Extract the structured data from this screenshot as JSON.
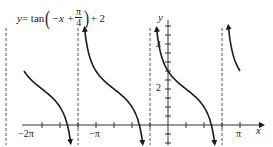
{
  "chart_data": {
    "type": "line",
    "title_parts": {
      "lhs": "y",
      "eq": " = tan",
      "inner_a": "−x +",
      "frac_num": "π",
      "frac_den": "4",
      "tail": "+ 2"
    },
    "function": "tan(-x + pi/4) + 2",
    "xlabel": "x",
    "ylabel": "y",
    "x_tick_labels": [
      "−2π",
      "−π",
      "π"
    ],
    "y_tick_labels": [
      "2",
      "4"
    ],
    "xlim": [
      "−2π",
      "π"
    ],
    "ylim": [
      -1,
      5.5
    ],
    "x_tick_spacing": "π/4",
    "y_tick_spacing": 0.5,
    "vertical_asymptotes": [
      "−9π/4",
      "−5π/4",
      "−π/4",
      "3π/4"
    ],
    "asymptote_style": "dashed",
    "grid": false,
    "legend": null,
    "branches": [
      {
        "x_from": "−2π",
        "x_to": "−5π/4",
        "start_y": 3,
        "end": "arrow down"
      },
      {
        "x_from": "−5π/4",
        "x_to": "−π/4",
        "start": "arrow up",
        "end": "arrow down"
      },
      {
        "x_from": "−π/4",
        "x_to": "3π/4",
        "start": "arrow up",
        "end": "arrow down",
        "y_intercept": 3
      },
      {
        "x_from": "3π/4",
        "x_to": "π",
        "start": "arrow up",
        "end_y": 3
      }
    ],
    "sample_points": [
      {
        "x": "−2π",
        "y": 3
      },
      {
        "x": "−3π/2",
        "y": 1
      },
      {
        "x": "−π",
        "y": 3
      },
      {
        "x": "−π/2",
        "y": 1
      },
      {
        "x": "0",
        "y": 3
      },
      {
        "x": "π/4",
        "y": 2
      },
      {
        "x": "π/2",
        "y": 1
      },
      {
        "x": "π",
        "y": 3
      }
    ]
  },
  "colors": {
    "curve": "#1a1a1a",
    "axis": "#333333",
    "asymptote": "#555555",
    "background": "#ffffff"
  }
}
